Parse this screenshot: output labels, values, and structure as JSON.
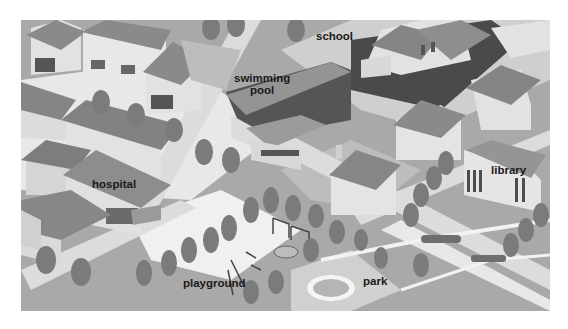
{
  "map": {
    "style": "grayscale isometric town illustration",
    "colors": {
      "ground": "#a9a9a9",
      "road": "#d8d8d8",
      "pavement": "#efefef",
      "roof": "#8a8a8a",
      "roof_dark": "#6e6e6e",
      "wall": "#e2e2e2",
      "wall_shade": "#bdbdbd",
      "tree": "#7b7b7b",
      "tree_dark": "#666666",
      "label": "#1a1a1a"
    },
    "labels": [
      {
        "id": "school",
        "text": "school",
        "x": 295,
        "y": 10
      },
      {
        "id": "swimming-pool",
        "line1": "swimming",
        "line2": "pool",
        "x": 213,
        "y": 52
      },
      {
        "id": "hospital",
        "text": "hospital",
        "x": 71,
        "y": 158
      },
      {
        "id": "library",
        "text": "library",
        "x": 470,
        "y": 144
      },
      {
        "id": "playground",
        "text": "playground",
        "x": 162,
        "y": 257
      },
      {
        "id": "park",
        "text": "park",
        "x": 342,
        "y": 255
      }
    ]
  }
}
